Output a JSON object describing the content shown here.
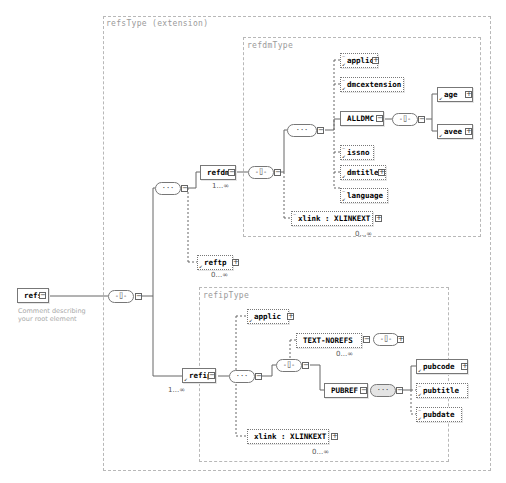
{
  "root": {
    "name": "refs",
    "annotation": "Comment describing your root element"
  },
  "types": {
    "refs_type": "refsType (extension)",
    "refdm_type": "refdmType",
    "refip_type": "refipType"
  },
  "refdm_branch": {
    "element": "refdm",
    "cardinality": "1...∞",
    "children": {
      "applic": "applic",
      "dmcextension": "dmcextension",
      "alldmc": "ALLDMC",
      "age": "age",
      "avee": "avee",
      "issno": "issno",
      "dmtitle": "dmtitle",
      "language": "language",
      "xlink": "xlink : XLINKEXT",
      "xlink_cardinality": "0...∞"
    }
  },
  "reftp": {
    "element": "reftp",
    "cardinality": "0...∞"
  },
  "refip_branch": {
    "element": "refip",
    "cardinality": "1...∞",
    "children": {
      "applic": "applic",
      "text_norefs": "TEXT-NOREFS",
      "text_norefs_cardinality": "0...∞",
      "pubref": "PUBREF",
      "pubcode": "pubcode",
      "pubtitle": "pubtitle",
      "pubdate": "pubdate",
      "xlink": "xlink : XLINKEXT",
      "xlink_cardinality": "0...∞"
    }
  },
  "icons": {
    "expand": "⊞",
    "collapse": "⊟",
    "sequence": "···",
    "choice": "-⌷-"
  }
}
